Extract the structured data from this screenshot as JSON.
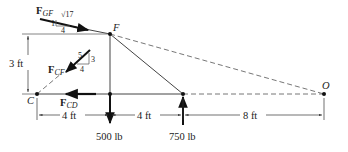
{
  "diagram": {
    "type": "free-body diagram (truss section)",
    "points": {
      "F": "F",
      "C": "C",
      "O": "O"
    },
    "forces": {
      "gf": {
        "letter": "F",
        "sub": "GF",
        "slope_rise": "1",
        "slope_run": "4",
        "slope_hyp": "√17"
      },
      "cf": {
        "letter": "F",
        "sub": "CF",
        "slope_rise": "3",
        "slope_run": "4",
        "slope_hyp": "5"
      },
      "cd": {
        "letter": "F",
        "sub": "CD"
      }
    },
    "loads": {
      "down": "500 lb",
      "up": "750 lb"
    },
    "dimensions": {
      "height": "3 ft",
      "span1": "4 ft",
      "span2": "4 ft",
      "span3": "8 ft"
    },
    "colors": {
      "line": "#333333",
      "dashed": "#666666",
      "arrow": "#111111"
    }
  }
}
